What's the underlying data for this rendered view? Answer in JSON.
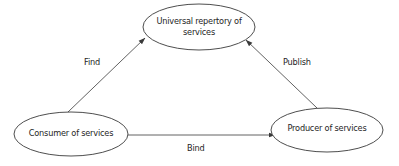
{
  "diagram": {
    "type": "service-oriented-architecture-triangle",
    "colors": {
      "stroke": "#3a3a3a",
      "text": "#1e1e1e",
      "background": "#ffffff"
    },
    "nodes": [
      {
        "id": "registry",
        "label_line1": "Universal repertory  of",
        "label_line2": "services",
        "shape": "ellipse"
      },
      {
        "id": "consumer",
        "label_line1": "Consumer of services",
        "shape": "ellipse"
      },
      {
        "id": "producer",
        "label_line1": "Producer of services",
        "shape": "ellipse"
      }
    ],
    "edges": [
      {
        "id": "find",
        "from": "consumer",
        "to": "registry",
        "label": "Find"
      },
      {
        "id": "publish",
        "from": "producer",
        "to": "registry",
        "label": "Publish"
      },
      {
        "id": "bind",
        "from": "consumer",
        "to": "producer",
        "label": "Bind"
      }
    ]
  }
}
